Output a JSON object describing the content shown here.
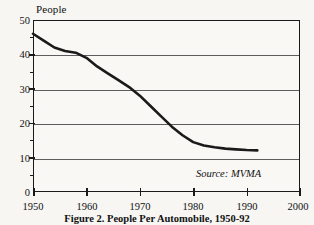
{
  "figure": {
    "caption": "Figure 2. People Per Automobile, 1950-92",
    "source_note": "Source: MVMA",
    "y_axis_title": "People"
  },
  "colors": {
    "line": "#1a1a1a",
    "frame": "#1a1a1a",
    "grid": "#5d5d5d",
    "background": "#f9f8f5",
    "page": "#f7f6f3"
  },
  "chart_data": {
    "type": "line",
    "title": "Figure 2. People Per Automobile, 1950-92",
    "xlabel": "",
    "ylabel": "People",
    "xlim": [
      1950,
      2000
    ],
    "ylim": [
      0,
      50
    ],
    "grid": true,
    "legend": "none",
    "annotations": [
      "Source: MVMA"
    ],
    "xticks": [
      1950,
      1960,
      1970,
      1980,
      1990,
      2000
    ],
    "yticks": [
      0,
      10,
      20,
      30,
      40,
      50
    ],
    "yticks_minor": [
      5,
      15,
      25,
      35,
      45
    ],
    "series": [
      {
        "name": "People per automobile",
        "x": [
          1950,
          1952,
          1954,
          1956,
          1958,
          1960,
          1962,
          1964,
          1966,
          1968,
          1970,
          1972,
          1974,
          1976,
          1978,
          1980,
          1982,
          1984,
          1986,
          1988,
          1990,
          1992
        ],
        "values": [
          46.0,
          44.0,
          42.0,
          41.0,
          40.5,
          39.0,
          36.5,
          34.5,
          32.5,
          30.5,
          28.0,
          25.0,
          22.0,
          19.0,
          16.5,
          14.5,
          13.5,
          13.0,
          12.6,
          12.4,
          12.2,
          12.1
        ]
      }
    ]
  },
  "ticks": {
    "x_labels": [
      "1950",
      "1960",
      "1970",
      "1980",
      "1990",
      "2000"
    ],
    "y_labels": [
      "0",
      "10",
      "20",
      "30",
      "40",
      "50"
    ]
  }
}
